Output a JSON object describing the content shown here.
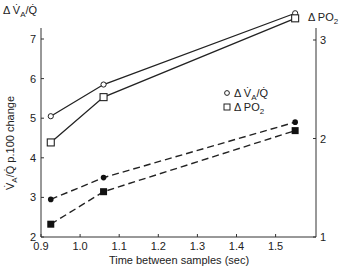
{
  "chart_data": {
    "type": "line",
    "title": "",
    "xlabel": "Time between samples (sec)",
    "ylabel_left": "V̇A/Q̇ p.100 change",
    "ylabel_left_top": "Δ V̇A/Q̇",
    "ylabel_right_top": "Δ PO2",
    "x_ticks": [
      "0.9",
      "1.0",
      "1.1",
      "1.2",
      "1.3",
      "1.4",
      "1.5"
    ],
    "y_left_ticks": [
      "2",
      "3",
      "4",
      "5",
      "6",
      "7"
    ],
    "y_right_ticks": [
      "1",
      "2",
      "3"
    ],
    "xlim": [
      0.9,
      1.6
    ],
    "ylim_left": [
      2,
      7.8
    ],
    "ylim_right": [
      1,
      3.3
    ],
    "x": [
      0.925,
      1.06,
      1.55
    ],
    "series": [
      {
        "name": "Δ V̇A/Q̇ (open circle, solid)",
        "axis": "left",
        "marker": "open-circle",
        "line": "solid",
        "values": [
          5.05,
          5.85,
          7.65
        ]
      },
      {
        "name": "Δ PO2 (open square, solid)",
        "axis": "right",
        "marker": "open-square",
        "line": "solid",
        "values": [
          1.96,
          2.42,
          3.22
        ]
      },
      {
        "name": "Δ V̇A/Q̇ (filled circle, dashed)",
        "axis": "left",
        "marker": "filled-circle",
        "line": "dashed",
        "values": [
          2.95,
          3.5,
          4.9
        ]
      },
      {
        "name": "Δ PO2 (filled square, dashed)",
        "axis": "right",
        "marker": "filled-square",
        "line": "dashed",
        "values": [
          1.13,
          1.46,
          2.08
        ]
      }
    ],
    "legend": [
      {
        "marker": "open-circle",
        "label": "Δ V̇A/Q̇"
      },
      {
        "marker": "open-square",
        "label": "Δ PO2"
      }
    ],
    "legend_position": "upper-right inside",
    "grid": false
  }
}
